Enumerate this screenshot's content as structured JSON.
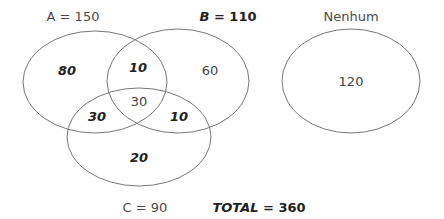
{
  "labels": {
    "set_a": "A = 150",
    "set_b_letter": "B",
    "set_b_rest": " = 110",
    "set_c": "C = 90",
    "none": "Nenhum",
    "total_word": "TOTAL",
    "total_rest": " = 360"
  },
  "regions": {
    "only_a": "80",
    "a_and_b": "10",
    "only_b": "60",
    "a_b_c": "30",
    "a_and_c": "30",
    "b_and_c": "10",
    "only_c": "20",
    "none": "120"
  },
  "colors": {
    "stroke": "#777777",
    "text": "#444444"
  }
}
